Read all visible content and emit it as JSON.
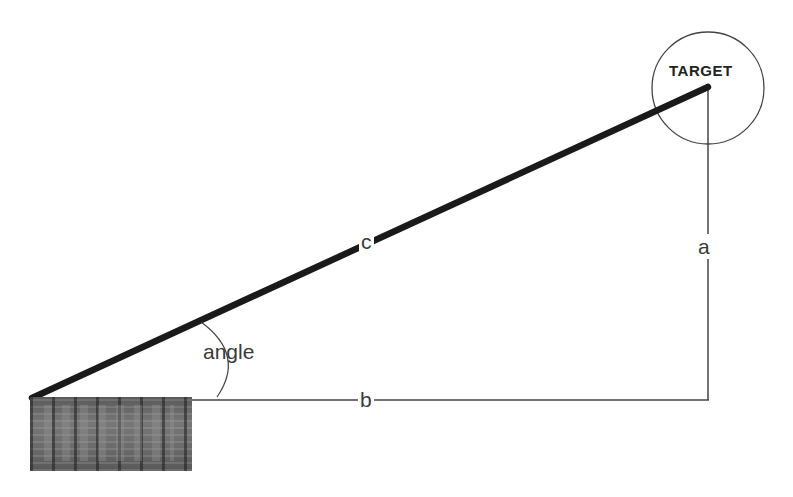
{
  "diagram": {
    "labels": {
      "hypotenuse": "c",
      "opposite": "a",
      "adjacent": "b",
      "angle": "angle",
      "target": "TARGET"
    },
    "colors": {
      "background": "#ffffff",
      "hypotenuse_line": "#1a1a1a",
      "thin_lines": "#3a3a3a",
      "label_text": "#3a3a3a"
    },
    "elements": {
      "origin_object": "building-photo",
      "target_marker": "circle"
    }
  }
}
